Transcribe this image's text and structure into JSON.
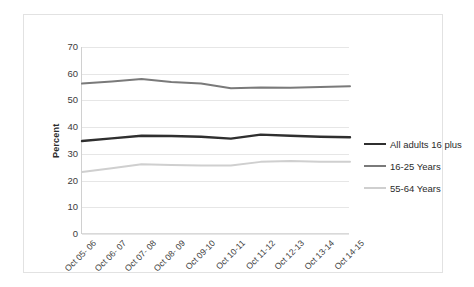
{
  "chart_data": {
    "type": "line",
    "title": "",
    "xlabel": "",
    "ylabel": "Percent",
    "ylim": [
      0,
      70
    ],
    "yticks": [
      0,
      10,
      20,
      30,
      40,
      50,
      60,
      70
    ],
    "grid": true,
    "legend_position": "right",
    "categories": [
      "Oct 05- 06",
      "Oct 06- 07",
      "Oct 07- 08",
      "Oct 08- 09",
      "Oct 09-10",
      "Oct 10-11",
      "Oct 11-12",
      "Oct 12-13",
      "Oct 13-14",
      "Oct 14-15"
    ],
    "series": [
      {
        "name": "All adults 16 plus",
        "color": "#2f2f2f",
        "width": 2.4,
        "values": [
          34.8,
          35.8,
          36.8,
          36.7,
          36.4,
          35.7,
          37.2,
          36.8,
          36.4,
          36.2
        ]
      },
      {
        "name": "16-25 Years",
        "color": "#7a7a7a",
        "width": 2.0,
        "values": [
          56.3,
          57.1,
          58.0,
          56.9,
          56.3,
          54.6,
          54.8,
          54.7,
          55.0,
          55.3
        ]
      },
      {
        "name": "55-64 Years",
        "color": "#cfcfcf",
        "width": 2.0,
        "values": [
          23.2,
          24.6,
          26.1,
          25.8,
          25.6,
          25.6,
          27.0,
          27.3,
          27.0,
          27.0
        ]
      }
    ]
  },
  "legend": {
    "items": [
      {
        "label": "All adults 16 plus",
        "color": "#2f2f2f"
      },
      {
        "label": "16-25 Years",
        "color": "#7a7a7a"
      },
      {
        "label": "55-64 Years",
        "color": "#cfcfcf"
      }
    ]
  }
}
